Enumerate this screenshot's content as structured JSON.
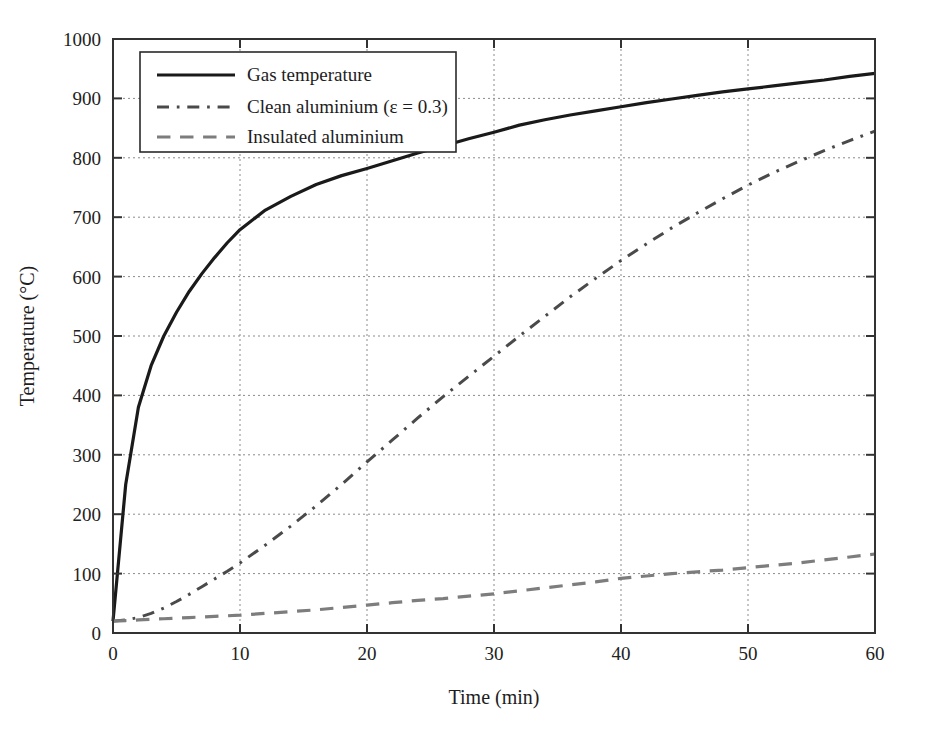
{
  "chart_data": {
    "type": "line",
    "title": "",
    "xlabel": "Time (min)",
    "ylabel": "Temperature (°C)",
    "xlim": [
      0,
      60
    ],
    "ylim": [
      0,
      1000
    ],
    "xticks": [
      0,
      10,
      20,
      30,
      40,
      50,
      60
    ],
    "yticks": [
      0,
      100,
      200,
      300,
      400,
      500,
      600,
      700,
      800,
      900,
      1000
    ],
    "grid": true,
    "grid_style": "dotted",
    "legend_position": "top-left",
    "background": "#ffffff",
    "x": [
      0,
      1,
      2,
      3,
      4,
      5,
      6,
      7,
      8,
      9,
      10,
      12,
      14,
      16,
      18,
      20,
      22,
      24,
      26,
      28,
      30,
      32,
      34,
      36,
      38,
      40,
      42,
      44,
      46,
      48,
      50,
      52,
      54,
      56,
      58,
      60
    ],
    "series": [
      {
        "name": "Gas temperature",
        "color": "#1a1a1a",
        "style": "solid",
        "width": 3.2,
        "values": [
          20,
          250,
          380,
          450,
          500,
          540,
          575,
          605,
          632,
          657,
          679,
          712,
          735,
          755,
          770,
          782,
          795,
          808,
          820,
          832,
          843,
          855,
          864,
          872,
          879,
          886,
          893,
          899,
          905,
          911,
          916,
          921,
          926,
          931,
          937,
          942
        ]
      },
      {
        "name": "Clean aluminium (ε = 0.3)",
        "color": "#4a4a4a",
        "style": "dashdot",
        "width": 3.0,
        "values": [
          20,
          22,
          26,
          33,
          42,
          53,
          65,
          78,
          91,
          104,
          118,
          148,
          180,
          214,
          250,
          288,
          325,
          362,
          398,
          432,
          466,
          500,
          533,
          566,
          597,
          627,
          655,
          682,
          707,
          731,
          754,
          775,
          794,
          812,
          829,
          845
        ]
      },
      {
        "name": "Insulated aluminium",
        "color": "#7d7d7d",
        "style": "dashed",
        "width": 3.2,
        "values": [
          20,
          21,
          22,
          23,
          24,
          25,
          26,
          27,
          28,
          29,
          30,
          33,
          36,
          39,
          43,
          47,
          51,
          55,
          58,
          62,
          66,
          71,
          76,
          81,
          86,
          92,
          96,
          100,
          103,
          106,
          110,
          114,
          118,
          123,
          128,
          133
        ]
      }
    ]
  },
  "legend": {
    "items": [
      {
        "label": "Gas temperature"
      },
      {
        "label": "Clean aluminium (ε = 0.3)"
      },
      {
        "label": "Insulated aluminium"
      }
    ]
  },
  "axes": {
    "x_title": "Time (min)",
    "y_title": "Temperature (°C)",
    "x_tick_labels": [
      "0",
      "10",
      "20",
      "30",
      "40",
      "50",
      "60"
    ],
    "y_tick_labels": [
      "0",
      "100",
      "200",
      "300",
      "400",
      "500",
      "600",
      "700",
      "800",
      "900",
      "1000"
    ]
  }
}
